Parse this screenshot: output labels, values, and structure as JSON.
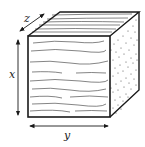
{
  "diagram": {
    "colors": {
      "line": "#1a1a1a",
      "background": "#ffffff"
    },
    "faces": [
      {
        "name": "front",
        "texture": "longitudinal grain lines"
      },
      {
        "name": "top",
        "texture": "longitudinal grain lines"
      },
      {
        "name": "right",
        "texture": "stippled end grain"
      }
    ],
    "axes": [
      {
        "id": "x",
        "label": "x",
        "orientation": "vertical",
        "position": "left"
      },
      {
        "id": "y",
        "label": "y",
        "orientation": "horizontal",
        "position": "bottom"
      },
      {
        "id": "z",
        "label": "z",
        "orientation": "diagonal",
        "position": "top-left"
      }
    ]
  }
}
